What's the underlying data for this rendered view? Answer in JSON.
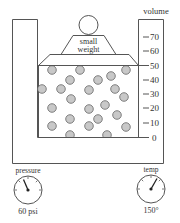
{
  "diagram": {
    "weight_label_line1": "small",
    "weight_label_line2": "weight",
    "scale": {
      "title": "volume",
      "ticks": [
        "70",
        "60",
        "50",
        "40",
        "30",
        "20",
        "10",
        "0"
      ]
    },
    "gauges": {
      "pressure": {
        "label": "pressure",
        "value": "60 psi"
      },
      "temp": {
        "label": "temp",
        "value": "150°"
      }
    },
    "molecule_count": 24,
    "colors": {
      "stroke": "#444444",
      "molecule_fill": "#c8c8c8",
      "background": "#ffffff"
    }
  }
}
